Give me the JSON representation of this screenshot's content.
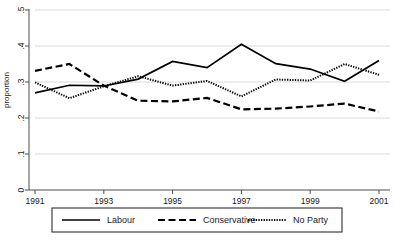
{
  "chart_data": {
    "type": "line",
    "title": "",
    "xlabel": "",
    "ylabel": "proportion",
    "x": [
      1991,
      1992,
      1993,
      1994,
      1995,
      1996,
      1997,
      1998,
      1999,
      2000,
      2001
    ],
    "xticks": [
      1991,
      1993,
      1995,
      1997,
      1999,
      2001
    ],
    "xtick_labels": [
      "1991",
      "1993",
      "1995",
      "1997",
      "1999",
      "2001"
    ],
    "xlim": [
      1991,
      2001
    ],
    "yticks": [
      0,
      0.1,
      0.2,
      0.3,
      0.4,
      0.5
    ],
    "ytick_labels": [
      "0",
      ".1",
      ".2",
      ".3",
      ".4",
      ".5"
    ],
    "ylim": [
      0,
      0.5
    ],
    "grid": "horizontal",
    "legend_position": "bottom",
    "series": [
      {
        "name": "Labour",
        "style": "solid",
        "color": "#000000",
        "values": [
          0.27,
          0.291,
          0.289,
          0.308,
          0.357,
          0.34,
          0.405,
          0.351,
          0.336,
          0.302,
          0.36
        ]
      },
      {
        "name": "Conservative",
        "style": "dashed",
        "color": "#000000",
        "values": [
          0.331,
          0.35,
          0.29,
          0.248,
          0.246,
          0.256,
          0.224,
          0.226,
          0.232,
          0.24,
          0.218
        ]
      },
      {
        "name": "No Party",
        "style": "dotted",
        "color": "#000000",
        "values": [
          0.299,
          0.255,
          0.288,
          0.316,
          0.29,
          0.303,
          0.26,
          0.307,
          0.304,
          0.35,
          0.32
        ]
      }
    ]
  },
  "legend": {
    "entries": [
      {
        "label": "Labour",
        "style": "solid"
      },
      {
        "label": "Conservative",
        "style": "dashed"
      },
      {
        "label": "No Party",
        "style": "dotted"
      }
    ]
  },
  "colors": {
    "line": "#000000",
    "grid": "#d9d9d9",
    "axis": "#4d4d4d",
    "background": "#ffffff",
    "legend_border": "#1a1a1a"
  }
}
